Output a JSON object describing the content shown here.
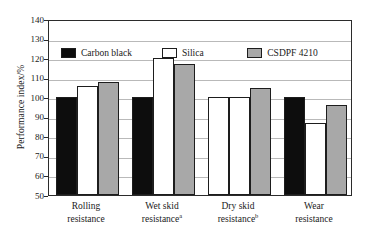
{
  "chart_data": {
    "type": "bar",
    "title": "",
    "xlabel": "",
    "ylabel": "Performance index/%",
    "ylim": [
      50,
      140
    ],
    "yticks": [
      50,
      60,
      70,
      80,
      90,
      100,
      110,
      120,
      130,
      140
    ],
    "ytick_labels": [
      "50",
      "60",
      "70",
      "80",
      "90",
      "100",
      "110",
      "120",
      "130",
      "140"
    ],
    "grid": true,
    "grid_axis": "y",
    "legend_position": "upper-left-inside",
    "categories": [
      "Rolling resistance",
      "Wet skid resistance",
      "Dry skid resistance",
      "Wear resistance"
    ],
    "category_lines": [
      [
        "Rolling",
        "resistance",
        ""
      ],
      [
        "Wet skid",
        "resistance",
        "a"
      ],
      [
        "Dry skid",
        "resistance",
        "b"
      ],
      [
        "Wear",
        "resistance",
        ""
      ]
    ],
    "series": [
      {
        "name": "Carbon black",
        "color": "#0d0d0d",
        "values": [
          100,
          100,
          100,
          100
        ]
      },
      {
        "name": "Silica",
        "color": "#ffffff",
        "values": [
          106,
          120,
          100,
          87
        ]
      },
      {
        "name": "CSDPF 4210",
        "color": "#a8a8a8",
        "values": [
          108,
          117,
          104.5,
          96
        ]
      }
    ]
  },
  "legend": {
    "items": [
      {
        "label": "Carbon black",
        "swatch": "black-filled-swatch"
      },
      {
        "label": "Silica",
        "swatch": "white-filled-swatch"
      },
      {
        "label": "CSDPF 4210",
        "swatch": "gray-filled-swatch"
      }
    ]
  },
  "axis": {
    "y_title": "Performance index/%"
  },
  "footnote_markers": [
    "a",
    "b"
  ]
}
